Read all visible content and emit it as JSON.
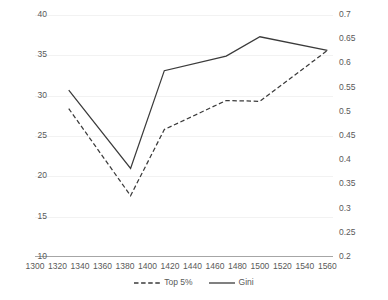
{
  "chart_data": {
    "type": "line",
    "title": "",
    "xlabel": "",
    "ylabel": "",
    "grid": true,
    "legend_position": "bottom",
    "x": [
      1330,
      1385,
      1415,
      1470,
      1500,
      1560
    ],
    "xlim": [
      1300,
      1565
    ],
    "xticks": [
      1300,
      1320,
      1340,
      1360,
      1380,
      1400,
      1420,
      1440,
      1460,
      1480,
      1500,
      1520,
      1540,
      1560
    ],
    "xtick_labels": [
      "1300",
      "1320",
      "1340",
      "1360",
      "1380",
      "1400",
      "1420",
      "1440",
      "1460",
      "1480",
      "1500",
      "1520",
      "1540",
      "1560"
    ],
    "axes": [
      {
        "id": "left",
        "label": "",
        "ylim": [
          10,
          40
        ],
        "yticks": [
          10,
          15,
          20,
          25,
          30,
          35,
          40
        ],
        "ytick_labels": [
          "10",
          "15",
          "20",
          "25",
          "30",
          "35",
          "40"
        ]
      },
      {
        "id": "right",
        "label": "",
        "ylim": [
          0.2,
          0.7
        ],
        "yticks": [
          0.2,
          0.25,
          0.3,
          0.35,
          0.4,
          0.45,
          0.5,
          0.55,
          0.6,
          0.65,
          0.7
        ],
        "ytick_labels": [
          "0.2",
          "0.25",
          "0.3",
          "0.35",
          "0.4",
          "0.45",
          "0.5",
          "0.55",
          "0.6",
          "0.65",
          "0.7"
        ]
      }
    ],
    "series": [
      {
        "name": "Top 5%",
        "axis": "left",
        "style": "dashed",
        "color": "#3b3b3b",
        "values": [
          28.4,
          17.6,
          25.8,
          29.4,
          29.3,
          35.6
        ]
      },
      {
        "name": "Gini",
        "axis": "right",
        "style": "solid",
        "color": "#3b3b3b",
        "values": [
          0.545,
          0.383,
          0.585,
          0.615,
          0.655,
          0.627
        ]
      }
    ],
    "legend": [
      {
        "label": "Top 5%",
        "style": "dashed"
      },
      {
        "label": "Gini",
        "style": "solid"
      }
    ]
  }
}
